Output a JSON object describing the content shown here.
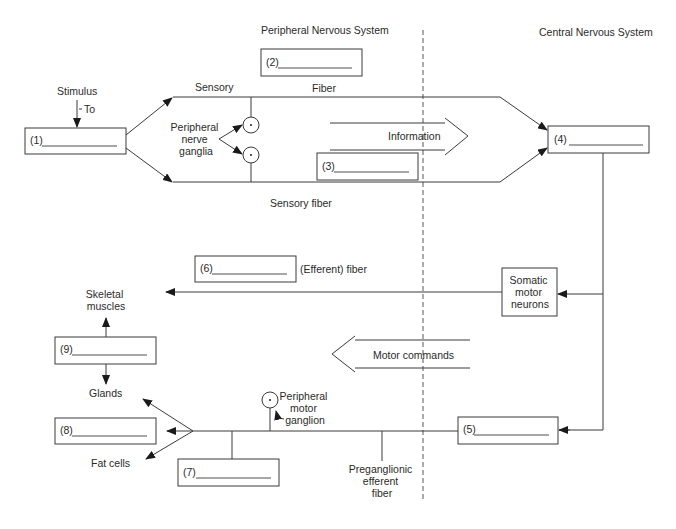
{
  "figure": {
    "sections": {
      "pns_title": "Peripheral Nervous System",
      "cns_title": "Central Nervous System"
    },
    "blanks": [
      {
        "id": "1",
        "label": "(1)"
      },
      {
        "id": "2",
        "label": "(2)"
      },
      {
        "id": "3",
        "label": "(3)"
      },
      {
        "id": "4",
        "label": "(4)"
      },
      {
        "id": "5",
        "label": "(5)"
      },
      {
        "id": "6",
        "label": "(6)"
      },
      {
        "id": "7",
        "label": "(7)"
      },
      {
        "id": "8",
        "label": "(8)"
      },
      {
        "id": "9",
        "label": "(9)"
      }
    ],
    "labels": {
      "stimulus": "Stimulus",
      "to": "To",
      "sensory": "Sensory",
      "fiber": "Fiber",
      "peripheral_nerve_ganglia": [
        "Peripheral",
        "nerve",
        "ganglia"
      ],
      "information": "Information",
      "sensory_fiber": "Sensory fiber",
      "efferent_fiber": "(Efferent) fiber",
      "somatic_motor_neurons": [
        "Somatic",
        "motor",
        "neurons"
      ],
      "skeletal_muscles": [
        "Skeletal",
        "muscles"
      ],
      "motor_commands": "Motor commands",
      "glands": "Glands",
      "fat_cells": "Fat cells",
      "peripheral_motor_ganglion": [
        "Peripheral",
        "motor",
        "ganglion"
      ],
      "preganglionic_efferent_fiber": [
        "Preganglionic",
        "efferent",
        "fiber"
      ]
    }
  }
}
